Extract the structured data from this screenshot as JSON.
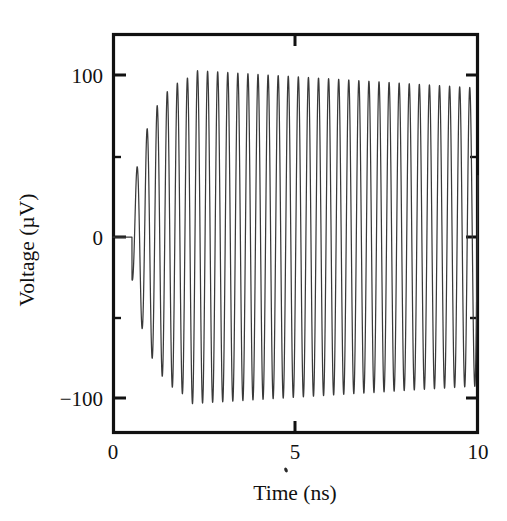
{
  "figure": {
    "name": "voltage-vs-time-oscillation-plot",
    "background_color": "#ffffff",
    "ink_color": "#111111",
    "trace_color": "#3a3a3a"
  },
  "axes": {
    "x_title": "Time (ns)",
    "y_title": "Voltage (µV)",
    "x_tick_labels": [
      "0",
      "5",
      "10"
    ],
    "y_tick_labels": [
      "100",
      "0",
      "−100"
    ]
  },
  "chart_data": {
    "type": "line",
    "title": "",
    "subtitle": "",
    "xlabel": "Time (ns)",
    "ylabel": "Voltage (µV)",
    "xlim": [
      0,
      10
    ],
    "ylim": [
      -125,
      123
    ],
    "xticks": [
      0,
      5,
      10
    ],
    "xtick_labels": [
      "0",
      "5",
      "10"
    ],
    "yticks": [
      -100,
      0,
      100
    ],
    "ytick_labels": [
      "−100",
      "0",
      "100"
    ],
    "y_minor_ticks": [
      -50,
      50
    ],
    "grid": false,
    "legend": null,
    "annotations": [],
    "series": [
      {
        "name": "voltage",
        "description": "Growing-then-saturating sinusoidal oscillation, onset near t = 0.5 ns",
        "waveform": {
          "model": "amplitude_ramp_sine",
          "onset_ns": 0.52,
          "frequency_ghz": 3.62,
          "period_ns": 0.276,
          "cycles_visible": 34,
          "phase_deg": -90,
          "amplitude_start_uv": 26,
          "amplitude_peak_uv": 103,
          "amplitude_peak_time_ns": 2.1,
          "amplitude_end_uv": 92,
          "ramp_time_constant_ns": 0.55,
          "baseline_uv": 0
        },
        "sampled_points": [
          {
            "t": 0.52,
            "v": 0
          },
          {
            "t": 0.6,
            "v": -28
          },
          {
            "t": 0.66,
            "v": 30
          },
          {
            "t": 0.8,
            "v": -56
          },
          {
            "t": 0.94,
            "v": 66
          },
          {
            "t": 1.08,
            "v": -82
          },
          {
            "t": 1.22,
            "v": 86
          },
          {
            "t": 1.35,
            "v": -94
          },
          {
            "t": 1.5,
            "v": 96
          },
          {
            "t": 1.63,
            "v": -99
          },
          {
            "t": 1.77,
            "v": 102
          },
          {
            "t": 1.91,
            "v": -101
          },
          {
            "t": 2.05,
            "v": 103
          },
          {
            "t": 2.18,
            "v": -102
          },
          {
            "t": 2.32,
            "v": 101
          },
          {
            "t": 2.46,
            "v": -103
          },
          {
            "t": 2.6,
            "v": 102
          },
          {
            "t": 2.74,
            "v": -104
          },
          {
            "t": 2.88,
            "v": 99
          },
          {
            "t": 3.15,
            "v": 97
          },
          {
            "t": 3.43,
            "v": 96
          },
          {
            "t": 3.7,
            "v": 97
          },
          {
            "t": 3.98,
            "v": 95
          },
          {
            "t": 4.25,
            "v": 96
          },
          {
            "t": 4.53,
            "v": 95
          },
          {
            "t": 4.8,
            "v": 94
          },
          {
            "t": 5.08,
            "v": 96
          },
          {
            "t": 5.36,
            "v": 94
          },
          {
            "t": 5.63,
            "v": 95
          },
          {
            "t": 5.91,
            "v": 93
          },
          {
            "t": 6.18,
            "v": 95
          },
          {
            "t": 6.46,
            "v": 93
          },
          {
            "t": 6.73,
            "v": 94
          },
          {
            "t": 7.01,
            "v": 93
          },
          {
            "t": 7.29,
            "v": 94
          },
          {
            "t": 7.56,
            "v": 92
          },
          {
            "t": 7.84,
            "v": 93
          },
          {
            "t": 8.11,
            "v": 92
          },
          {
            "t": 8.39,
            "v": 93
          },
          {
            "t": 8.66,
            "v": 91
          },
          {
            "t": 8.94,
            "v": 92
          },
          {
            "t": 9.22,
            "v": 91
          },
          {
            "t": 9.49,
            "v": 92
          },
          {
            "t": 9.77,
            "v": 90
          },
          {
            "t": 10.0,
            "v": -58
          }
        ]
      }
    ]
  }
}
